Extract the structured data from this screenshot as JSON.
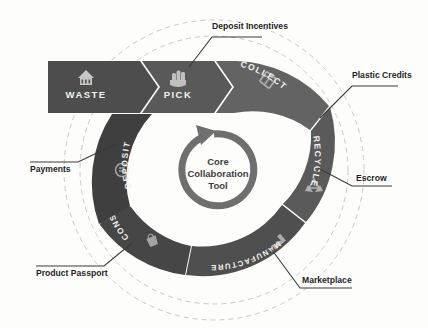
{
  "diagram": {
    "hub": {
      "line1": "Core",
      "line2": "Collaboration",
      "line3": "Tool",
      "arrow_icon": "circular-arrow-icon"
    },
    "colors": {
      "segment_dark": "#4a4a4a",
      "segment_mid": "#565656",
      "segment_light": "#6a6a6a",
      "hub_ring": "#6f6f6f",
      "label_text": "#1f1f1f",
      "segment_text": "#f2f2f0",
      "dashed_guide": "#c9c9c4",
      "background": "#fdfdfc"
    },
    "banner_segments": [
      {
        "label": "WASTE",
        "icon": "waste-bin-icon",
        "shade": "#4d4d4d"
      },
      {
        "label": "PICK",
        "icon": "hand-pick-icon",
        "shade": "#595959"
      }
    ],
    "ring_segments": [
      {
        "label": "COLLECT",
        "icon": "collect-box-icon",
        "shade": "#636363"
      },
      {
        "label": "RECYCLE",
        "icon": "recycle-arrows-icon",
        "shade": "#5a5a5a"
      },
      {
        "label": "MANUFACTURE",
        "icon": "factory-icon",
        "shade": "#4f4f4f"
      },
      {
        "label": "CONSUME",
        "icon": "shopping-bag-icon",
        "shade": "#464646"
      },
      {
        "label": "DEPOSIT",
        "icon": "coin-icon",
        "shade": "#3f3f3f"
      }
    ],
    "callouts": [
      {
        "label": "Deposit Incentives",
        "anchor": "top",
        "target_segment": "PICK"
      },
      {
        "label": "Plastic Credits",
        "anchor": "top-right",
        "target_segment": "COLLECT"
      },
      {
        "label": "Escrow",
        "anchor": "right",
        "target_segment": "RECYCLE"
      },
      {
        "label": "Marketplace",
        "anchor": "bottom-right",
        "target_segment": "MANUFACTURE"
      },
      {
        "label": "Product Passport",
        "anchor": "bottom-left",
        "target_segment": "CONSUME"
      },
      {
        "label": "Payments",
        "anchor": "left",
        "target_segment": "DEPOSIT"
      }
    ],
    "guides": [
      {
        "name": "outer-dashed-circle"
      },
      {
        "name": "inner-dashed-circle"
      }
    ]
  }
}
